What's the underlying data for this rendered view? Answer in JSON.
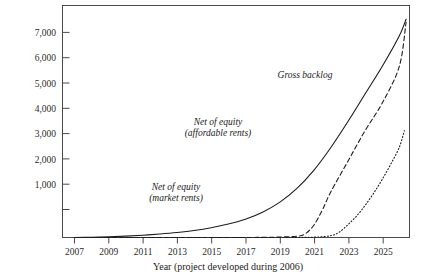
{
  "chart_data": {
    "type": "line",
    "title": "",
    "xlabel": "Year (project developed during 2006)",
    "ylabel": "",
    "xlim": [
      2006.3,
      2026.6
    ],
    "ylim": [
      0,
      7600
    ],
    "grid": false,
    "legend_position": "inline-annotations",
    "y_ticks": [
      0,
      1000,
      2000,
      3000,
      4000,
      5000,
      6000,
      7000
    ],
    "y_tick_labels": [
      "",
      "1,000",
      "2,000",
      "3,000",
      "4,000",
      "5,000",
      "6,000",
      "7,000"
    ],
    "x_ticks": [
      2007,
      2009,
      2011,
      2013,
      2015,
      2017,
      2019,
      2021,
      2023,
      2025
    ],
    "x_tick_labels": [
      "2007",
      "2009",
      "2011",
      "2013",
      "2015",
      "2017",
      "2019",
      "2021",
      "2023",
      "2025"
    ],
    "series": [
      {
        "name": "Gross backlog",
        "style": "solid",
        "annotation": "Gross backlog",
        "x": [
          2007,
          2008,
          2009,
          2010,
          2011,
          2012,
          2013,
          2014,
          2015,
          2016,
          2017,
          2018,
          2019,
          2020,
          2021,
          2022,
          2023,
          2024,
          2025,
          2026,
          2026.4
        ],
        "y": [
          0,
          10,
          25,
          45,
          75,
          115,
          165,
          230,
          320,
          440,
          600,
          830,
          1150,
          1600,
          2200,
          2950,
          3800,
          4700,
          5600,
          6600,
          7150
        ]
      },
      {
        "name": "Net of equity (affordable rents)",
        "style": "dashed",
        "annotation_line1": "Net of equity",
        "annotation_line2": "(affordable rents)",
        "x": [
          2007,
          2011,
          2015,
          2017,
          2018,
          2019,
          2020,
          2020.5,
          2021,
          2021.5,
          2022,
          2023,
          2024,
          2025,
          2026,
          2026.4
        ],
        "y": [
          0,
          0,
          0,
          0,
          5,
          15,
          40,
          120,
          400,
          900,
          1500,
          2500,
          3500,
          4400,
          5600,
          7050
        ]
      },
      {
        "name": "Net of equity (market rents)",
        "style": "dotted",
        "annotation_line1": "Net of equity",
        "annotation_line2": "(market rents)",
        "x": [
          2007,
          2015,
          2019,
          2021,
          2022,
          2022.5,
          2023,
          2023.5,
          2024,
          2024.5,
          2025,
          2025.5,
          2026,
          2026.3
        ],
        "y": [
          0,
          0,
          0,
          10,
          60,
          180,
          420,
          700,
          1050,
          1450,
          1900,
          2400,
          2950,
          3500
        ]
      }
    ],
    "annotations": [
      {
        "text": "Gross backlog",
        "x_px": 305,
        "y_px": 78
      },
      {
        "text_line1": "Net of equity",
        "text_line2": "(affordable rents)",
        "x_px": 218,
        "y_px": 125
      },
      {
        "text_line1": "Net of equity",
        "text_line2": "(market rents)",
        "x_px": 176,
        "y_px": 190
      }
    ]
  },
  "axis": {
    "x_title": "Year (project developed during 2006)"
  },
  "colors": {
    "ink": "#1c1c1c",
    "frame": "#4a4a4a",
    "background": "#ffffff"
  }
}
